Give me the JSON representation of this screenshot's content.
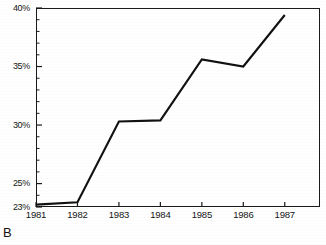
{
  "chart_data": {
    "type": "line",
    "title": "",
    "subtitle": "",
    "xlabel": "",
    "ylabel": "",
    "panel_label": "B",
    "categories": [
      "1981",
      "1982",
      "1983",
      "1984",
      "1985",
      "1986",
      "1987"
    ],
    "x": [
      1981,
      1982,
      1983,
      1984,
      1985,
      1986,
      1987
    ],
    "values": [
      23.2,
      23.4,
      30.3,
      30.4,
      35.6,
      35.0,
      39.4
    ],
    "series": [
      {
        "name": "percent",
        "values": [
          23.2,
          23.4,
          30.3,
          30.4,
          35.6,
          35.0,
          39.4
        ]
      }
    ],
    "ylim": [
      23,
      40
    ],
    "xlim": [
      1981,
      1987.85
    ],
    "ytick_labels": [
      "23%",
      "25%",
      "30%",
      "35%",
      "40%"
    ],
    "ytick_values": [
      23,
      25,
      30,
      35,
      40
    ],
    "yminor_step": 1,
    "xtick_labels": [
      "1981",
      "1982",
      "1983",
      "1984",
      "1985",
      "1986",
      "1987"
    ],
    "grid": false,
    "legend": false,
    "legend_position": "none",
    "line_color": "#111111",
    "marker": "none",
    "annotations": []
  },
  "figure": {
    "panel_caption": "B",
    "frame_color": "#1a1a1a",
    "background": "#ffffff"
  }
}
